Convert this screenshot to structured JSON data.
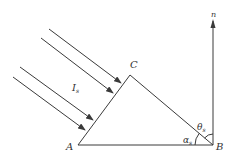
{
  "diagram": {
    "type": "geometry",
    "colors": {
      "line": "#3a3a3a",
      "text": "#333333",
      "background": "#ffffff"
    },
    "vertices": {
      "A": {
        "label": "A",
        "x": 78,
        "y": 145
      },
      "B": {
        "label": "B",
        "x": 213,
        "y": 145
      },
      "C": {
        "label": "C",
        "x": 130,
        "y": 75
      }
    },
    "normal": {
      "label": "n",
      "from": [
        213,
        145
      ],
      "to": [
        213,
        20
      ]
    },
    "rays": [
      {
        "from": [
          49,
          29
        ],
        "to": [
          121,
          83
        ]
      },
      {
        "from": [
          41,
          38
        ],
        "to": [
          113,
          93
        ]
      },
      {
        "from": [
          20,
          67
        ],
        "to": [
          93,
          120
        ]
      },
      {
        "from": [
          13,
          77
        ],
        "to": [
          85,
          130
        ]
      }
    ],
    "labels": {
      "intensity": {
        "main": "I",
        "sub": "s"
      },
      "alpha": {
        "main": "α",
        "sub": "s"
      },
      "theta": {
        "main": "θ",
        "sub": "s"
      },
      "A": "A",
      "B": "B",
      "C": "C",
      "n": "n"
    }
  }
}
